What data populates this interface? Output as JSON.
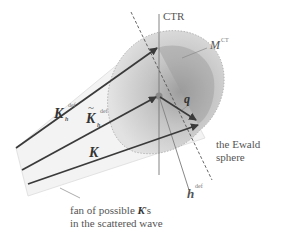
{
  "diagram": {
    "labels": {
      "ctr": "CTR",
      "m_sym": "M",
      "m_sup": "CT",
      "q": "q",
      "kh_sym": "K",
      "kh_sub": "h",
      "kh_sup": "def",
      "kt_tilde": "~",
      "kt_sym": "K",
      "kt_sub": "h",
      "kt_sup": "def",
      "k": "K",
      "h_sym": "h",
      "h_sup": "def",
      "ewald_line1": "the Ewald",
      "ewald_line2": "sphere",
      "fan_line1_a": "fan of possible ",
      "fan_line1_k": "K",
      "fan_line1_b": "'s",
      "fan_line2": "in the scattered wave"
    },
    "colors": {
      "arrow": "#3a3a3a",
      "region_outer": "#d9d9d9",
      "region_inner": "#a8a8a8",
      "fan": "#f2f2f2",
      "line": "#777777"
    }
  }
}
